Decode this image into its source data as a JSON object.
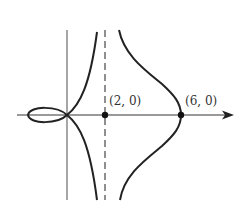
{
  "figure": {
    "type": "curve-sketch",
    "points": [
      {
        "label": "(2, 0)",
        "x": 2,
        "y": 0
      },
      {
        "label": "(6, 0)",
        "x": 6,
        "y": 0
      }
    ],
    "asymptote": {
      "type": "vertical",
      "style": "dashed",
      "x": 2
    },
    "colors": {
      "curve": "#222222",
      "axis": "#666666"
    }
  }
}
